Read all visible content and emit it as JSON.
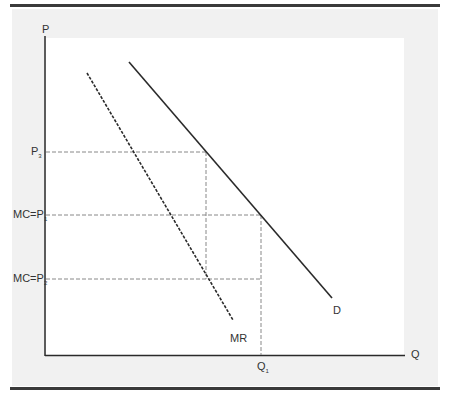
{
  "diagram": {
    "title": "",
    "axes": {
      "y_label": "P",
      "x_label": "Q"
    },
    "price_labels": [
      {
        "main": "P",
        "sub": "3",
        "prefix": ""
      },
      {
        "main": "MC=P",
        "sub": "1",
        "prefix": ""
      },
      {
        "main": "MC=P",
        "sub": "2",
        "prefix": ""
      }
    ],
    "quantity_labels": [
      {
        "main": "Q",
        "sub": "1"
      }
    ],
    "curves": [
      {
        "name": "D",
        "label": "D",
        "style": "solid",
        "from": [
          129,
          62
        ],
        "to": [
          332,
          298
        ]
      },
      {
        "name": "MR",
        "label": "MR",
        "style": "dashed",
        "from": [
          87,
          73
        ],
        "to": [
          233,
          320
        ]
      }
    ],
    "guides": {
      "p3_y": 152,
      "p1_y": 215,
      "p2_y": 279,
      "x_at_p3": 206,
      "q1_x": 261
    },
    "colors": {
      "line": "#2a2a2a",
      "guide": "#888888",
      "background": "#f1f1f1",
      "plot": "#ffffff"
    }
  }
}
